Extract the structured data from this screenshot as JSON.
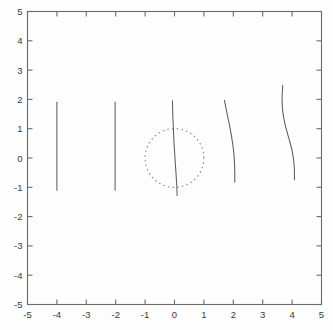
{
  "chart_data": {
    "type": "line",
    "title": "",
    "xlabel": "",
    "ylabel": "",
    "xlim": [
      -5,
      5
    ],
    "ylim": [
      -5,
      5
    ],
    "grid": false,
    "legend": null,
    "xticks": [
      -5,
      -4,
      -3,
      -2,
      -1,
      0,
      1,
      2,
      3,
      4,
      5
    ],
    "yticks": [
      -5,
      -4,
      -3,
      -2,
      -1,
      0,
      1,
      2,
      3,
      4,
      5
    ],
    "xticklabels": [
      "-5",
      "-4",
      "-3",
      "-2",
      "-1",
      "0",
      "1",
      "2",
      "3",
      "4",
      "5"
    ],
    "yticklabels": [
      "-5",
      "-4",
      "-3",
      "-2",
      "-1",
      "0",
      "1",
      "2",
      "3",
      "4",
      "5"
    ],
    "series": [
      {
        "name": "curve-x-minus-4",
        "style": "solid",
        "x": [
          -4.0,
          -4.0,
          -4.0,
          -4.0,
          -4.0,
          -4.0,
          -4.0
        ],
        "y": [
          1.9,
          1.4,
          0.9,
          0.4,
          -0.1,
          -0.6,
          -1.1
        ]
      },
      {
        "name": "curve-x-minus-2",
        "style": "solid",
        "x": [
          -2.02,
          -2.02,
          -2.02,
          -2.02,
          -2.02,
          -2.02,
          -2.02
        ],
        "y": [
          1.91,
          1.41,
          0.91,
          0.41,
          -0.09,
          -0.59,
          -1.1
        ]
      },
      {
        "name": "curve-through-origin",
        "style": "solid",
        "x": [
          -0.07,
          -0.06,
          -0.04,
          -0.02,
          0.01,
          0.04,
          0.07,
          0.09
        ],
        "y": [
          1.95,
          1.5,
          1.05,
          0.58,
          0.1,
          -0.36,
          -0.82,
          -1.28
        ]
      },
      {
        "name": "curve-near-x-2",
        "style": "solid",
        "x": [
          1.7,
          1.78,
          1.87,
          1.95,
          2.01,
          2.04,
          2.05,
          2.05
        ],
        "y": [
          1.97,
          1.55,
          1.12,
          0.68,
          0.25,
          -0.15,
          -0.5,
          -0.82
        ]
      },
      {
        "name": "curve-near-x-4",
        "style": "solid",
        "x": [
          3.68,
          3.66,
          3.68,
          3.76,
          3.88,
          4.0,
          4.07,
          4.08
        ],
        "y": [
          2.48,
          2.05,
          1.6,
          1.15,
          0.7,
          0.25,
          -0.25,
          -0.74
        ]
      }
    ],
    "annotations": [
      {
        "name": "unit-circle",
        "shape": "circle",
        "center": [
          0,
          0
        ],
        "radius": 1,
        "style": "dotted"
      }
    ]
  },
  "colors": {
    "curve": "#5d5d5d",
    "axis": "#6b6b6b",
    "circle": "#8e8e8e",
    "label": "#3a3a3a",
    "background": "#fdfdfd"
  }
}
